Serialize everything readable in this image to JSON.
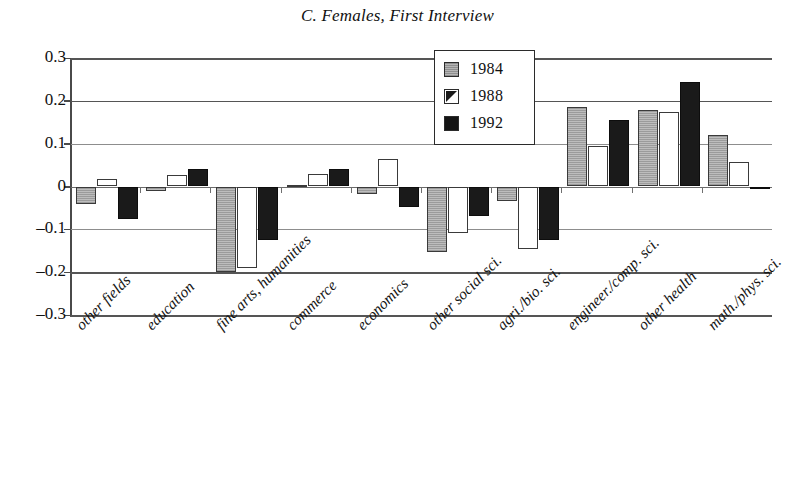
{
  "chart_data": {
    "type": "bar",
    "title": "C. Females, First Interview",
    "xlabel": "",
    "ylabel": "",
    "ylim": [
      -0.3,
      0.3
    ],
    "yticks": [
      "0.3",
      "0.2",
      "0.1",
      "0",
      "–0.1",
      "–0.2",
      "–0.3"
    ],
    "ytick_values": [
      0.3,
      0.2,
      0.1,
      0,
      -0.1,
      -0.2,
      -0.3
    ],
    "grid": true,
    "legend_position": "top-center-right",
    "categories": [
      "other fields",
      "education",
      "fine arts, humanities",
      "commerce",
      "economics",
      "other social  sci.",
      "agri./bio. sci.",
      "engineer./comp. sci.",
      "other health",
      "math./phys. sci."
    ],
    "series": [
      {
        "name": "1984",
        "color": "#b0b0b0",
        "values": [
          -0.042,
          -0.01,
          -0.2,
          0.004,
          -0.018,
          -0.153,
          -0.033,
          0.185,
          0.178,
          0.12
        ]
      },
      {
        "name": "1988",
        "color": "#ffffff",
        "values": [
          0.018,
          0.027,
          -0.19,
          0.029,
          0.065,
          -0.108,
          -0.145,
          0.095,
          0.173,
          0.058
        ]
      },
      {
        "name": "1992",
        "color": "#141414",
        "values": [
          -0.075,
          0.041,
          -0.125,
          0.04,
          -0.048,
          -0.07,
          -0.125,
          0.155,
          0.243,
          -0.005
        ]
      }
    ]
  },
  "legend": {
    "items": [
      {
        "label": "1984",
        "swatch": "gray-hatch-swatch"
      },
      {
        "label": "1988",
        "swatch": "white-diagonal-swatch"
      },
      {
        "label": "1992",
        "swatch": "black-swatch"
      }
    ]
  }
}
